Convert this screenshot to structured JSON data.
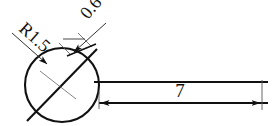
{
  "drawing": {
    "type": "engineering-dimension-sketch",
    "background_color": "#ffffff",
    "line_color": "#111111",
    "thin_line_color": "#555555",
    "title": "Sealing strip cross-section with radius and thickness dimensions",
    "dimensions": [
      {
        "id": "radius",
        "label": "R1.5",
        "kind": "radius",
        "value": 1.5,
        "prefix": "R",
        "target": "circle",
        "leader_angle_deg": 45,
        "rotation_deg": 45,
        "text_position": {
          "x": 18,
          "y": 30
        }
      },
      {
        "id": "thickness",
        "label": "0.6",
        "kind": "linear",
        "value": 0.6,
        "target": "strip-thickness",
        "rotation_deg": -45,
        "text_position": {
          "x": 92,
          "y": 22
        }
      },
      {
        "id": "length",
        "label": "7",
        "kind": "linear",
        "value": 7,
        "target": "strip-length",
        "rotation_deg": 0,
        "text_position": {
          "x": 180,
          "y": 96
        }
      }
    ],
    "geometry": {
      "circle": {
        "cx": 62,
        "cy": 85,
        "r": 37
      },
      "diagonal_line": {
        "x1": 28,
        "y1": 120,
        "x2": 96,
        "y2": 50
      },
      "strip_top_line": {
        "x1": 95,
        "y1": 82,
        "x2": 268,
        "y2": 82
      },
      "strip_bottom_line": {
        "x1": 95,
        "y1": 103,
        "x2": 268,
        "y2": 103
      }
    }
  }
}
